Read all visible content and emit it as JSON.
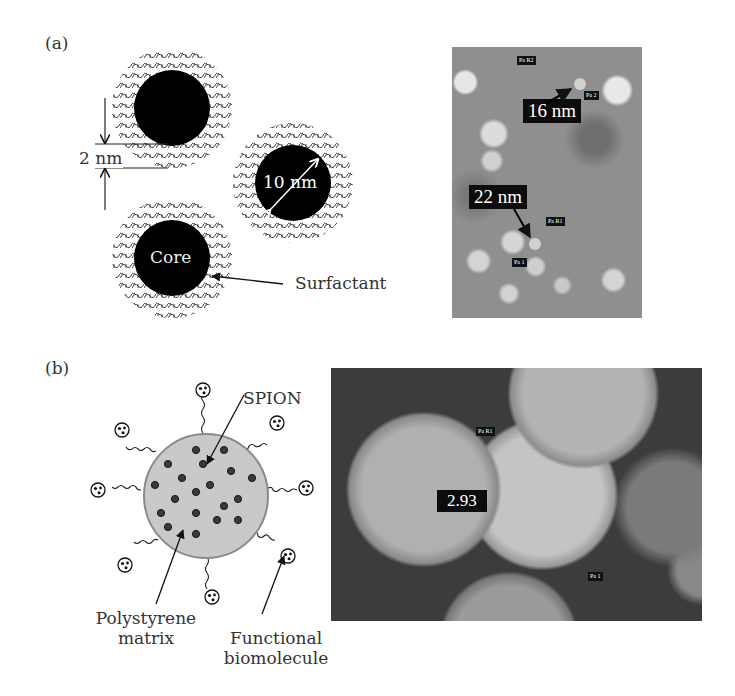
{
  "panel_a": {
    "label": "(a)",
    "schematic": {
      "gap_label": "2 nm",
      "diameter_label": "10 nm",
      "core_label": "Core",
      "surfactant_label": "Surfactant"
    },
    "micrograph": {
      "measure_top": "16 nm",
      "measure_bottom": "22 nm",
      "tag_pa_r2": "Pa R2",
      "tag_pa_2": "Pa 2",
      "tag_pa_r1": "Pa R1",
      "tag_pa_1": "Pa 1"
    }
  },
  "panel_b": {
    "label": "(b)",
    "schematic": {
      "spion_label": "SPION",
      "matrix_label_line1": "Polystyrene",
      "matrix_label_line2": "matrix",
      "biomolecule_label_line1": "Functional",
      "biomolecule_label_line2": "biomolecule"
    },
    "micrograph": {
      "measure": "2.93",
      "tag_pa_r1": "Pa R1",
      "tag_pa_1": "Pa 1"
    }
  },
  "colors": {
    "core": "#000000",
    "matrix_fill": "#c8c8c8",
    "matrix_stroke": "#8a8a8a",
    "spion": "#3a3a3a",
    "micro_a_bg": "#8f8f8f",
    "micro_b_bg": "#4a4a4a"
  }
}
